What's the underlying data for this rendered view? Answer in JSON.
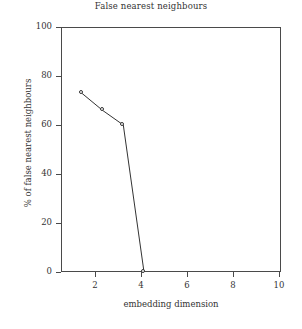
{
  "chart_data": {
    "type": "line",
    "title": "False nearest neighbours",
    "xlabel": "embedding dimension",
    "ylabel": "% of false nearest neighbours",
    "x": [
      1,
      2,
      3,
      4
    ],
    "values": [
      73,
      66,
      60,
      0
    ],
    "series": [
      {
        "name": "% of false nearest neighbours",
        "values": [
          73,
          66,
          60,
          0
        ]
      }
    ],
    "xlim": [
      0,
      10.6
    ],
    "ylim": [
      0,
      100
    ],
    "xticks": [
      2,
      4,
      6,
      8,
      10
    ],
    "yticks": [
      0,
      20,
      40,
      60,
      80,
      100
    ],
    "xtick_labels": [
      "2",
      "4",
      "6",
      "8",
      "10"
    ],
    "ytick_labels": [
      "0",
      "20",
      "40",
      "60",
      "80",
      "100"
    ],
    "grid": false,
    "legend": "none",
    "marker": "open-circle",
    "line_color": "#333333",
    "frame_color": "#4a4a4a",
    "background": "#ffffff"
  }
}
